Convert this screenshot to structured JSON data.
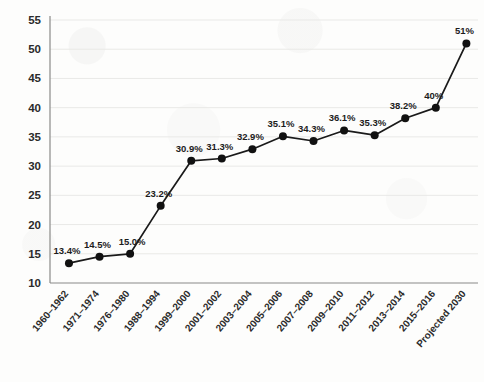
{
  "chart_data": {
    "type": "line",
    "title": "",
    "subtitle": "",
    "xlabel": "",
    "ylabel": "",
    "ylim": [
      10,
      55
    ],
    "yticks": [
      10,
      15,
      20,
      25,
      30,
      35,
      40,
      45,
      50,
      55
    ],
    "grid": true,
    "legend": false,
    "legend_position": "none",
    "categories": [
      "1960–1962",
      "1971–1974",
      "1976–1980",
      "1988–1994",
      "1999–2000",
      "2001–2002",
      "2003–2004",
      "2005–2006",
      "2007–2008",
      "2009–2010",
      "2011–2012",
      "2013–2014",
      "2015–2016",
      "Projected 2030"
    ],
    "values": [
      13.4,
      14.5,
      15.0,
      23.2,
      30.9,
      31.3,
      32.9,
      35.1,
      34.3,
      36.1,
      35.3,
      38.2,
      40.0,
      51.0
    ],
    "point_labels": [
      "13.4%",
      "14.5%",
      "15.0%",
      "23.2%",
      "30.9%",
      "31.3%",
      "32.9%",
      "35.1%",
      "34.3%",
      "36.1%",
      "35.3%",
      "38.2%",
      "40%",
      "51%"
    ],
    "series": [
      {
        "name": "Prevalence",
        "values": [
          13.4,
          14.5,
          15.0,
          23.2,
          30.9,
          31.3,
          32.9,
          35.1,
          34.3,
          36.1,
          35.3,
          38.2,
          40.0,
          51.0
        ]
      }
    ],
    "colors": {
      "line": "#1a1a1a",
      "marker": "#111111",
      "grid": "#e9e9e7",
      "axis": "#8a8a88",
      "text": "#2b2b2b",
      "background": "#fdfdfc"
    }
  }
}
